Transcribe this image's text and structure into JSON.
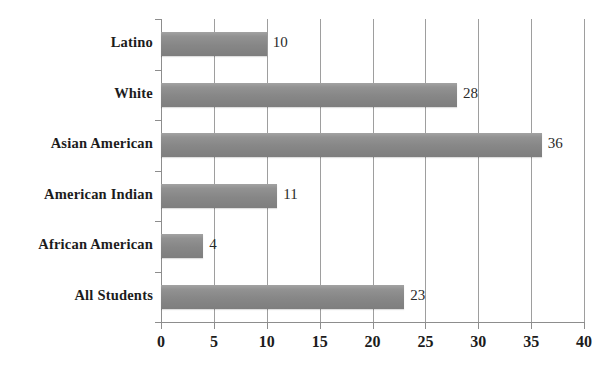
{
  "chart_data": {
    "type": "bar",
    "orientation": "horizontal",
    "title": "",
    "subtitle": "",
    "xlabel": "",
    "ylabel": "",
    "categories": [
      "Latino",
      "White",
      "Asian American",
      "American Indian",
      "African American",
      "All Students"
    ],
    "values": [
      10,
      28,
      36,
      11,
      4,
      23
    ],
    "value_labels": [
      "10",
      "28",
      "36",
      "11",
      "4",
      "23"
    ],
    "xlim": [
      0,
      40
    ],
    "xticks": [
      0,
      5,
      10,
      15,
      20,
      25,
      30,
      35,
      40
    ],
    "xtick_labels": [
      "0",
      "5",
      "10",
      "15",
      "20",
      "25",
      "30",
      "35",
      "40"
    ],
    "grid": true,
    "grid_axis": "x",
    "legend": false,
    "bar_color": "#8c8c8c",
    "axis_color": "#8d8d8d",
    "grid_color": "#9e9e9e",
    "text_color": "#1c1c1c",
    "background": "#ffffff"
  },
  "rows": [
    {
      "label": "Latino",
      "value": 10,
      "value_label": "10"
    },
    {
      "label": "White",
      "value": 28,
      "value_label": "28"
    },
    {
      "label": "Asian American",
      "value": 36,
      "value_label": "36"
    },
    {
      "label": "American Indian",
      "value": 11,
      "value_label": "11"
    },
    {
      "label": "African American",
      "value": 4,
      "value_label": "4"
    },
    {
      "label": "All Students",
      "value": 23,
      "value_label": "23"
    }
  ],
  "xaxis": {
    "ticks": [
      "0",
      "5",
      "10",
      "15",
      "20",
      "25",
      "30",
      "35",
      "40"
    ]
  }
}
